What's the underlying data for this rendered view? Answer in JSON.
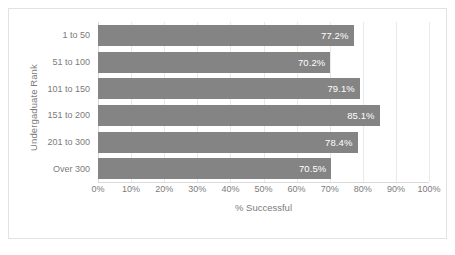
{
  "chart_data": {
    "type": "bar",
    "orientation": "horizontal",
    "title": "",
    "xlabel": "% Successful",
    "ylabel": "Undergaduate Rank",
    "categories": [
      "1 to 50",
      "51 to 100",
      "101 to 150",
      "151 to 200",
      "201 to 300",
      "Over 300"
    ],
    "values": [
      77.2,
      70.2,
      79.1,
      85.1,
      78.4,
      70.5
    ],
    "data_labels": [
      "77.2%",
      "70.2%",
      "79.1%",
      "85.1%",
      "78.4%",
      "70.5%"
    ],
    "xlim": [
      0,
      100
    ],
    "xticks": [
      0,
      10,
      20,
      30,
      40,
      50,
      60,
      70,
      80,
      90,
      100
    ],
    "xtick_labels": [
      "0%",
      "10%",
      "20%",
      "30%",
      "40%",
      "50%",
      "60%",
      "70%",
      "80%",
      "90%",
      "100%"
    ],
    "grid": "vertical",
    "legend": "none",
    "colors": {
      "bar": "#848484",
      "data_label": "#ffffff",
      "gridline": "#e9e9e9",
      "axis_line": "#d9d9d9",
      "axis_text": "#7b7b7b",
      "plot_background": "#ffffff",
      "border": "#e2e2e2"
    }
  }
}
